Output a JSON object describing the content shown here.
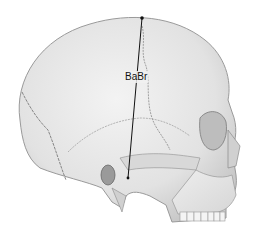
{
  "figure": {
    "measurement_label": "BaBr",
    "line_color": "#111111",
    "bone_fill": "#ececec",
    "bone_shade": "#cfcfcf",
    "outline_color": "#8a8a8a",
    "measurement_line": {
      "from": [
        142,
        18
      ],
      "to": [
        128,
        178
      ]
    }
  }
}
